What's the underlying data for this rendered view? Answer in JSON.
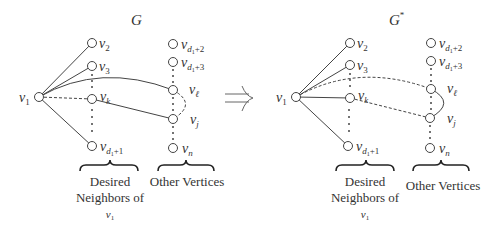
{
  "panels": [
    {
      "id": "G",
      "title": "G",
      "title_sup": "",
      "offset_x": 0,
      "nodes": {
        "v1": {
          "x": 39,
          "y": 97,
          "label": "v",
          "sub": "1"
        },
        "v2": {
          "x": 92,
          "y": 43,
          "label": "v",
          "sub": "2"
        },
        "v3": {
          "x": 92,
          "y": 66,
          "label": "v",
          "sub": "3"
        },
        "vk": {
          "x": 92,
          "y": 99,
          "label": "v",
          "sub": "k"
        },
        "vd1p1": {
          "x": 92,
          "y": 146,
          "label": "v",
          "sub": "d",
          "subsub": "1",
          "tail": "+1"
        },
        "vd1p2": {
          "x": 173,
          "y": 44,
          "label": "v",
          "sub": "d",
          "subsub": "1",
          "tail": "+2"
        },
        "vd1p3": {
          "x": 173,
          "y": 62,
          "label": "v",
          "sub": "d",
          "subsub": "1",
          "tail": "+3"
        },
        "vl": {
          "x": 173,
          "y": 90,
          "label": "v",
          "sub": "ℓ"
        },
        "vj": {
          "x": 173,
          "y": 119,
          "label": "v",
          "sub": "j"
        },
        "vn": {
          "x": 173,
          "y": 148,
          "label": "v",
          "sub": "n"
        }
      },
      "edges": [
        {
          "from": "v1",
          "to": "v2",
          "style": "solid"
        },
        {
          "from": "v1",
          "to": "v3",
          "style": "solid"
        },
        {
          "from": "v1",
          "to": "vd1p1",
          "style": "solid"
        },
        {
          "from": "v1",
          "to": "vk",
          "style": "dashed"
        },
        {
          "from": "v1",
          "to": "vl",
          "style": "solid",
          "curved": true
        },
        {
          "from": "vk",
          "to": "vj",
          "style": "solid"
        },
        {
          "from": "vl",
          "to": "vj",
          "style": "dashed",
          "curved": true
        }
      ]
    },
    {
      "id": "G*",
      "title": "G",
      "title_sup": "*",
      "offset_x": 258,
      "edges": [
        {
          "from": "v1",
          "to": "v2",
          "style": "solid"
        },
        {
          "from": "v1",
          "to": "v3",
          "style": "solid"
        },
        {
          "from": "v1",
          "to": "vd1p1",
          "style": "solid"
        },
        {
          "from": "v1",
          "to": "vk",
          "style": "solid"
        },
        {
          "from": "v1",
          "to": "vl",
          "style": "dashed",
          "curved": true
        },
        {
          "from": "vk",
          "to": "vj",
          "style": "dashed"
        },
        {
          "from": "vl",
          "to": "vj",
          "style": "solid",
          "curved": true
        }
      ]
    }
  ],
  "groups": {
    "desired": {
      "line1": "Desired",
      "line2": "Neighbors of",
      "line3_var": "v",
      "line3_sub": "1"
    },
    "other": {
      "label": "Other Vertices"
    }
  },
  "arrow": {
    "symbol": "implies",
    "meaning": "transforms into"
  },
  "colors": {
    "stroke": "#444444",
    "text": "#333333",
    "background": "#ffffff"
  }
}
